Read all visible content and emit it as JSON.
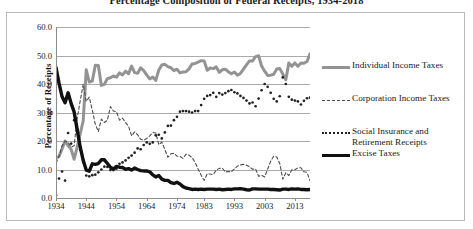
{
  "chart_title": "Percentage Composition of Federal Receipts, 1934-2018",
  "axes": {
    "ylabel": "Percentage of Receipts",
    "yticks": [
      "0.0",
      "10.0",
      "20.0",
      "30.0",
      "40.0",
      "50.0",
      "60.0"
    ],
    "xticks": [
      "1934",
      "1944",
      "1954",
      "1964",
      "1974",
      "1983",
      "1993",
      "2003",
      "2013"
    ]
  },
  "legend": {
    "items": [
      {
        "label": "Individual Income Taxes",
        "style": "solid-gray",
        "color": "#939393"
      },
      {
        "label": "Corporation Income Taxes",
        "style": "dashed",
        "color": "#4d4d4d"
      },
      {
        "label": "Social Insurance and\nRetirement Receipts",
        "style": "dotted",
        "color": "#222222"
      },
      {
        "label": "Excise Taxes",
        "style": "solid-black",
        "color": "#111111"
      }
    ]
  },
  "chart_data": {
    "type": "line",
    "title": "Percentage Composition of Federal Receipts, 1934-2018",
    "xlabel": "",
    "ylabel": "Percentage of Receipts",
    "xlim": [
      1934,
      2018
    ],
    "ylim": [
      0.0,
      60.0
    ],
    "ytick_step": 10.0,
    "grid": true,
    "legend_position": "right",
    "x": [
      1934,
      1935,
      1936,
      1937,
      1938,
      1939,
      1940,
      1941,
      1942,
      1943,
      1944,
      1945,
      1946,
      1947,
      1948,
      1949,
      1950,
      1951,
      1952,
      1953,
      1954,
      1955,
      1956,
      1957,
      1958,
      1959,
      1960,
      1961,
      1962,
      1963,
      1964,
      1965,
      1966,
      1967,
      1968,
      1969,
      1970,
      1971,
      1972,
      1973,
      1974,
      1975,
      1976,
      1977,
      1978,
      1979,
      1980,
      1981,
      1982,
      1983,
      1984,
      1985,
      1986,
      1987,
      1988,
      1989,
      1990,
      1991,
      1992,
      1993,
      1994,
      1995,
      1996,
      1997,
      1998,
      1999,
      2000,
      2001,
      2002,
      2003,
      2004,
      2005,
      2006,
      2007,
      2008,
      2009,
      2010,
      2011,
      2012,
      2013,
      2014,
      2015,
      2016,
      2017,
      2018
    ],
    "series": [
      {
        "name": "Individual Income Taxes",
        "style": "solid",
        "color": "#939393",
        "width": 3,
        "values": [
          14.2,
          14.6,
          17.2,
          20.0,
          18.4,
          17.1,
          13.6,
          17.9,
          22.5,
          27.1,
          45.0,
          40.7,
          41.0,
          46.6,
          46.5,
          39.5,
          39.9,
          41.9,
          42.2,
          42.8,
          42.4,
          43.9,
          43.2,
          44.5,
          43.6,
          46.3,
          44.0,
          43.8,
          45.7,
          44.7,
          43.2,
          41.8,
          42.4,
          41.3,
          44.9,
          46.7,
          46.9,
          46.1,
          45.7,
          44.7,
          45.2,
          43.9,
          44.2,
          44.3,
          45.3,
          47.0,
          47.2,
          47.7,
          48.2,
          48.1,
          44.8,
          45.6,
          45.4,
          46.0,
          44.1,
          45.0,
          45.2,
          44.3,
          43.6,
          44.2,
          43.1,
          43.7,
          45.2,
          46.7,
          48.1,
          48.1,
          49.6,
          49.9,
          46.3,
          44.5,
          43.0,
          43.1,
          43.4,
          45.3,
          45.4,
          43.5,
          41.5,
          47.4,
          46.2,
          47.4,
          46.2,
          47.4,
          47.3,
          47.9,
          50.6
        ]
      },
      {
        "name": "Corporation Income Taxes",
        "style": "dashed",
        "color": "#4d4d4d",
        "width": 1.1,
        "values": [
          12.3,
          14.6,
          18.3,
          20.0,
          19.5,
          17.9,
          18.3,
          27.9,
          34.1,
          39.9,
          33.9,
          35.4,
          30.9,
          25.8,
          23.3,
          27.7,
          26.5,
          27.3,
          32.1,
          30.5,
          30.3,
          27.3,
          28.0,
          26.5,
          25.2,
          21.8,
          23.2,
          22.2,
          20.6,
          20.3,
          20.9,
          21.8,
          23.0,
          22.8,
          18.7,
          19.6,
          17.0,
          14.3,
          15.5,
          15.7,
          14.7,
          14.6,
          13.9,
          15.4,
          15.0,
          14.2,
          12.5,
          10.2,
          8.0,
          6.2,
          8.5,
          8.4,
          8.2,
          9.8,
          10.4,
          10.5,
          9.1,
          9.3,
          9.2,
          10.2,
          11.2,
          11.6,
          11.8,
          11.5,
          11.0,
          10.1,
          10.2,
          7.6,
          8.0,
          7.4,
          10.1,
          12.9,
          14.7,
          14.4,
          12.1,
          6.6,
          8.9,
          7.9,
          9.9,
          9.9,
          10.6,
          10.6,
          9.2,
          9.0,
          6.1
        ]
      },
      {
        "name": "Social Insurance and Retirement Receipts",
        "style": "dotted",
        "color": "#222222",
        "width": 2.2,
        "values": [
          1.0,
          6.8,
          9.3,
          6.1,
          22.8,
          19.1,
          27.3,
          24.2,
          17.0,
          12.7,
          7.9,
          7.6,
          8.0,
          8.2,
          9.0,
          10.0,
          11.0,
          10.9,
          9.8,
          9.8,
          10.3,
          12.0,
          12.5,
          13.2,
          14.1,
          14.9,
          15.9,
          17.4,
          17.1,
          18.6,
          19.5,
          19.0,
          19.5,
          22.0,
          22.2,
          20.9,
          23.0,
          25.3,
          25.4,
          27.3,
          28.5,
          30.3,
          30.5,
          30.5,
          30.3,
          30.0,
          30.5,
          30.5,
          32.6,
          34.8,
          35.8,
          36.1,
          36.9,
          35.5,
          36.8,
          36.3,
          36.8,
          37.5,
          37.9,
          37.1,
          36.7,
          35.8,
          35.1,
          34.2,
          33.2,
          33.5,
          32.2,
          34.9,
          37.8,
          40.0,
          39.0,
          36.9,
          34.8,
          33.9,
          35.7,
          42.3,
          40.0,
          35.5,
          34.5,
          34.2,
          33.9,
          32.8,
          34.1,
          35.0,
          35.2
        ]
      },
      {
        "name": "Excise Taxes",
        "style": "solid",
        "color": "#111111",
        "width": 3.4,
        "values": [
          45.8,
          40.3,
          35.6,
          33.4,
          36.9,
          33.2,
          30.2,
          24.0,
          17.9,
          13.2,
          9.8,
          9.4,
          12.0,
          11.8,
          12.1,
          13.4,
          13.4,
          12.1,
          10.8,
          10.2,
          11.1,
          10.8,
          10.7,
          10.1,
          10.3,
          9.8,
          10.5,
          10.0,
          9.6,
          9.5,
          9.5,
          9.2,
          8.1,
          7.4,
          7.9,
          6.6,
          6.2,
          6.2,
          5.4,
          5.1,
          5.5,
          4.9,
          4.0,
          3.5,
          3.3,
          3.0,
          3.1,
          3.0,
          3.1,
          3.0,
          3.1,
          3.1,
          3.1,
          3.0,
          3.1,
          2.9,
          3.0,
          3.1,
          3.0,
          3.2,
          3.2,
          3.3,
          3.1,
          2.9,
          2.8,
          3.2,
          3.2,
          3.1,
          3.1,
          3.1,
          3.1,
          3.0,
          3.0,
          2.9,
          2.8,
          3.1,
          3.1,
          3.0,
          3.2,
          3.1,
          3.2,
          3.0,
          3.0,
          2.9,
          3.0
        ]
      }
    ]
  }
}
